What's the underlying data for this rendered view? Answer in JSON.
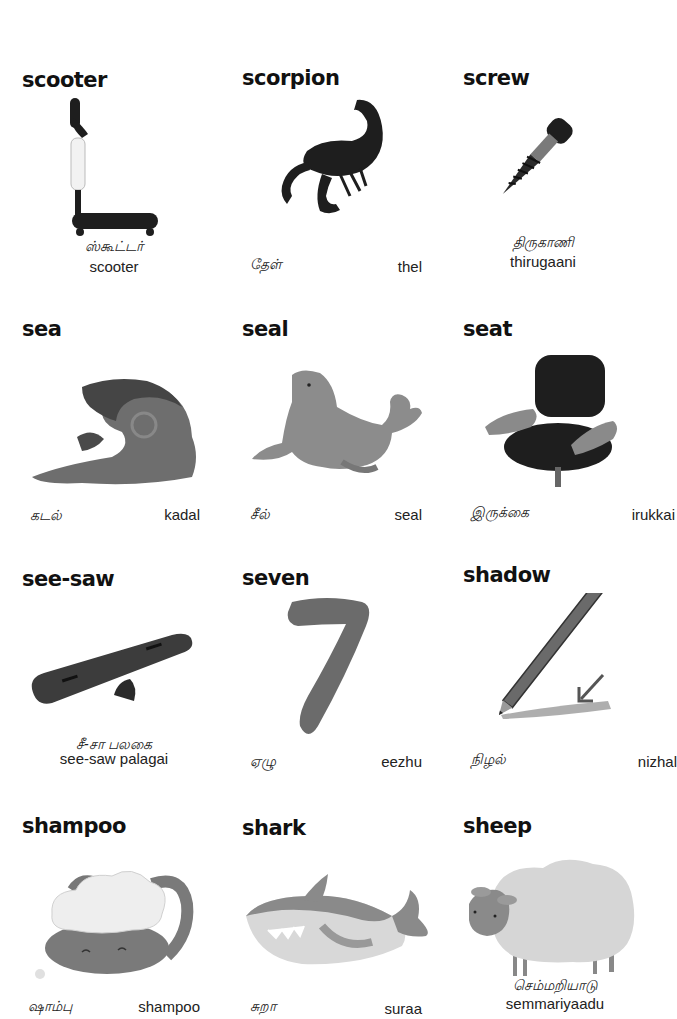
{
  "cards": [
    {
      "word": "scooter",
      "tamil": "ஸ்கூட்டர்",
      "roman": "scooter",
      "layout": "stacked",
      "icon": "scooter-image"
    },
    {
      "word": "scorpion",
      "tamil": "தேள்",
      "roman": "thel",
      "layout": "split",
      "icon": "scorpion-image"
    },
    {
      "word": "screw",
      "tamil": "திருகாணி",
      "roman": "thirugaani",
      "layout": "stacked",
      "icon": "screw-image"
    },
    {
      "word": "sea",
      "tamil": "கடல்",
      "roman": "kadal",
      "layout": "split",
      "icon": "sea-wave-image"
    },
    {
      "word": "seal",
      "tamil": "சீல்",
      "roman": "seal",
      "layout": "split",
      "icon": "seal-image"
    },
    {
      "word": "seat",
      "tamil": "இருக்கை",
      "roman": "irukkai",
      "layout": "split",
      "icon": "seat-chair-image"
    },
    {
      "word": "see-saw",
      "tamil": "சீ-சா பலகை",
      "roman": "see-saw palagai",
      "layout": "stacked",
      "icon": "see-saw-image"
    },
    {
      "word": "seven",
      "tamil": "ஏழு",
      "roman": "eezhu",
      "layout": "split",
      "icon": "number-seven-image"
    },
    {
      "word": "shadow",
      "tamil": "நிழல்",
      "roman": "nizhal",
      "layout": "split",
      "icon": "pencil-shadow-image"
    },
    {
      "word": "shampoo",
      "tamil": "ஷாம்பு",
      "roman": "shampoo",
      "layout": "split",
      "icon": "shampoo-cat-image"
    },
    {
      "word": "shark",
      "tamil": "சுறா",
      "roman": "suraa",
      "layout": "split",
      "icon": "shark-image"
    },
    {
      "word": "sheep",
      "tamil": "செம்மறியாடு",
      "roman": "semmariyaadu",
      "layout": "stacked",
      "icon": "sheep-image"
    }
  ],
  "colors": {
    "ink": "#111111",
    "dark_fill": "#1e1e1e",
    "mid_gray": "#6b6b6b",
    "light_gray": "#bdbdbd",
    "background": "#ffffff"
  }
}
